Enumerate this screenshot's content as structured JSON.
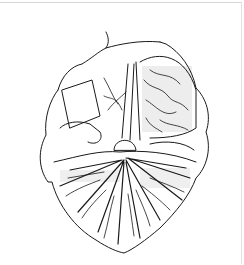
{
  "image": {
    "kind": "line-art illustration",
    "subject": "heart-shaped organ cross-section drawing",
    "style": "black ink stipple and hatching on white",
    "colors": {
      "background": "#ffffff",
      "ink": "#1a1a1a",
      "border": "#d8d8d8"
    }
  }
}
